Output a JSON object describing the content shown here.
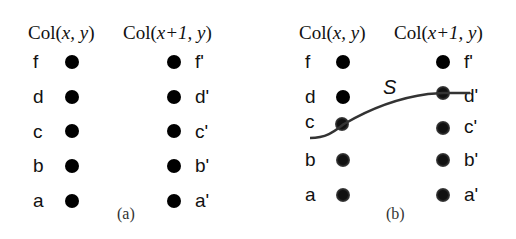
{
  "panels": [
    {
      "id": "a",
      "caption": "(a)",
      "header_left": {
        "prefix": "Col(",
        "args": "x, y",
        "suffix": ")"
      },
      "header_right": {
        "prefix": "Col(",
        "args": "x+1, y",
        "suffix": ")"
      },
      "left_labels": [
        "f",
        "d",
        "c",
        "b",
        "a"
      ],
      "right_labels": [
        "f'",
        "d'",
        "c'",
        "b'",
        "a'"
      ]
    },
    {
      "id": "b",
      "caption": "(b)",
      "header_left": {
        "prefix": "Col(",
        "args": "x, y",
        "suffix": ")"
      },
      "header_right": {
        "prefix": "Col(",
        "args": "x+1, y",
        "suffix": ")"
      },
      "left_labels": [
        "f",
        "d",
        "c",
        "b",
        "a"
      ],
      "right_labels": [
        "f'",
        "d'",
        "c'",
        "b'",
        "a'"
      ],
      "curve_label": "S"
    }
  ]
}
